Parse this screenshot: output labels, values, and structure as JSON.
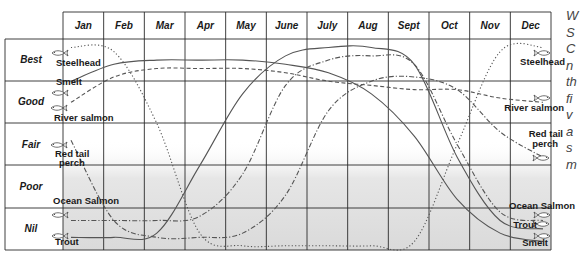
{
  "chart_data": {
    "type": "line",
    "title": "",
    "xlabel": "",
    "ylabel": "Fishing quality",
    "categories": [
      "Jan",
      "Feb",
      "Mar",
      "Apr",
      "May",
      "June",
      "July",
      "Aug",
      "Sept",
      "Oct",
      "Nov",
      "Dec"
    ],
    "y_levels": [
      "Best",
      "Good",
      "Fair",
      "Poor",
      "Nil"
    ],
    "ylim": [
      0,
      5
    ],
    "grid": true,
    "legend_position": "inline labels at left and right ends of curves",
    "series": [
      {
        "name": "Steelhead",
        "style": "dotted",
        "values": [
          4.8,
          4.7,
          3.0,
          0.4,
          0.1,
          0.1,
          0.1,
          0.1,
          0.2,
          2.5,
          4.7,
          4.8
        ]
      },
      {
        "name": "Smelt",
        "style": "solid",
        "values": [
          4.0,
          4.4,
          4.5,
          4.5,
          4.5,
          4.4,
          4.2,
          3.7,
          2.7,
          1.2,
          0.4,
          0.2
        ]
      },
      {
        "name": "River salmon",
        "style": "dashed",
        "values": [
          3.5,
          4.1,
          4.3,
          4.3,
          4.3,
          4.2,
          4.0,
          3.9,
          3.8,
          3.8,
          3.6,
          3.5
        ]
      },
      {
        "name": "Red tail perch",
        "style": "dash-dot",
        "values": [
          2.6,
          0.7,
          0.3,
          0.3,
          0.4,
          1.3,
          3.3,
          4.0,
          4.1,
          3.8,
          2.8,
          2.2
        ]
      },
      {
        "name": "Ocean Salmon",
        "style": "dash-dot",
        "values": [
          0.7,
          0.7,
          0.7,
          0.8,
          1.8,
          3.9,
          4.5,
          4.6,
          4.4,
          2.5,
          0.9,
          0.7
        ]
      },
      {
        "name": "Trout",
        "style": "solid",
        "values": [
          0.3,
          0.3,
          0.4,
          2.0,
          3.7,
          4.6,
          4.8,
          4.8,
          4.4,
          2.2,
          0.7,
          0.5
        ]
      }
    ]
  },
  "months": [
    "Jan",
    "Feb",
    "Mar",
    "Apr",
    "May",
    "June",
    "July",
    "Aug",
    "Sept",
    "Oct",
    "Nov",
    "Dec"
  ],
  "ratings": [
    "Best",
    "Good",
    "Fair",
    "Poor",
    "Nil"
  ],
  "labels_left": {
    "steelhead": "Steelhead",
    "smelt": "Smelt",
    "river_salmon": "River salmon",
    "red_tail_perch_1": "Red tail",
    "red_tail_perch_2": "perch",
    "ocean_salmon": "Ocean Salmon",
    "trout": "Trout"
  },
  "labels_right": {
    "steelhead": "Steelhead",
    "river_salmon": "River salmon",
    "red_tail_perch_1": "Red tail",
    "red_tail_perch_2": "perch",
    "ocean_salmon": "Ocean Salmon",
    "trout": "Trout",
    "smelt": "Smelt"
  },
  "side_text": [
    "W",
    "S",
    "C",
    "n",
    "th",
    "fi",
    "v",
    "a",
    "s",
    "m"
  ],
  "colors": {
    "ink": "#1a1a1a",
    "curve": "#555555",
    "shade": "#e4e4e4",
    "side_text": "#444444"
  }
}
